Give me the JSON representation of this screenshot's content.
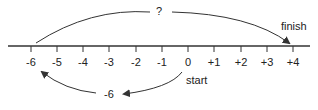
{
  "diagram": {
    "type": "number-line",
    "ticks": [
      {
        "label": "-6",
        "x": 31
      },
      {
        "label": "-5",
        "x": 57
      },
      {
        "label": "-4",
        "x": 83
      },
      {
        "label": "-3",
        "x": 109
      },
      {
        "label": "-2",
        "x": 136
      },
      {
        "label": "-1",
        "x": 162
      },
      {
        "label": "0",
        "x": 188
      },
      {
        "label": "+1",
        "x": 214
      },
      {
        "label": "+2",
        "x": 241
      },
      {
        "label": "+3",
        "x": 267
      },
      {
        "label": "+4",
        "x": 293
      }
    ],
    "top_arc_label": "?",
    "bottom_arc_label": "-6",
    "start_label": "start",
    "finish_label": "finish",
    "line_color": "#333333"
  }
}
